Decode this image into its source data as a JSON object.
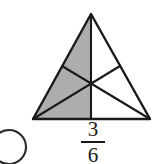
{
  "figure": {
    "name": "shaded-fraction-triangle",
    "shape": "triangle",
    "total_parts": 6,
    "shaded_parts": 3,
    "shade_color": "#adadad",
    "unshaded_color": "#ffffff",
    "outline_color": "#1a1a1a",
    "partition_method": "medians-from-each-vertex",
    "shaded_region_positions": [
      "upper-left",
      "middle-left",
      "lower-left"
    ],
    "unshaded_region_positions": [
      "upper-right",
      "middle-right",
      "lower-right"
    ],
    "vertices": {
      "apex": "91,14",
      "bottom_left": "33,119",
      "bottom_right": "150,119"
    },
    "centroid": "91,86",
    "midpoints": {
      "left_side": "62,66",
      "right_side": "120,66",
      "base": "91,119"
    }
  },
  "label": {
    "fraction_numerator": "3",
    "fraction_denominator": "6",
    "fraction_text": "3/6"
  },
  "answer_bubble": {
    "name": "answer-choice-bubble",
    "state": "unselected",
    "outline_color": "#2b2b2b"
  }
}
